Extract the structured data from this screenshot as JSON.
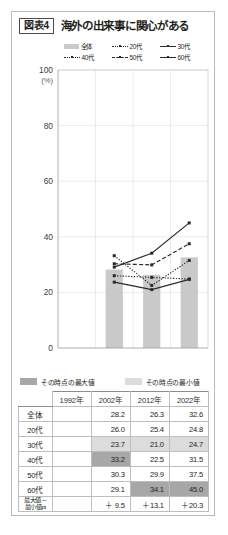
{
  "figure": {
    "badge": "図表4",
    "title": "海外の出来事に関心がある"
  },
  "legend": [
    {
      "label": "全体",
      "style": "bar"
    },
    {
      "label": "20代",
      "style": "dotted"
    },
    {
      "label": "30代",
      "style": "solid"
    },
    {
      "label": "40代",
      "style": "dotted"
    },
    {
      "label": "50代",
      "style": "dashed"
    },
    {
      "label": "60代",
      "style": "solid"
    }
  ],
  "minmax_legend": [
    {
      "label": "その時点の最大値",
      "color": "#a7a7a7"
    },
    {
      "label": "その時点の最小値",
      "color": "#dcdcdc"
    }
  ],
  "axis": {
    "y_unit": "(%)",
    "y_ticks": [
      "100",
      "80",
      "60",
      "40",
      "20",
      "0"
    ]
  },
  "chart_data": {
    "type": "line",
    "title": "海外の出来事に関心がある",
    "xlabel": "",
    "ylabel": "(%)",
    "ylim": [
      0,
      100
    ],
    "yticks": [
      0,
      20,
      40,
      60,
      80,
      100
    ],
    "grid": true,
    "legend_position": "top",
    "categories": [
      "1992年",
      "2002年",
      "2012年",
      "2022年"
    ],
    "bars": {
      "name": "全体",
      "color": "#c9c9c9",
      "values": [
        null,
        28.2,
        26.3,
        32.6
      ]
    },
    "series": [
      {
        "name": "20代",
        "style": "dotted",
        "values": [
          null,
          26.0,
          25.4,
          24.8
        ]
      },
      {
        "name": "30代",
        "style": "solid",
        "values": [
          null,
          23.7,
          21.0,
          24.7
        ]
      },
      {
        "name": "40代",
        "style": "dotted",
        "values": [
          null,
          33.2,
          22.5,
          31.5
        ]
      },
      {
        "name": "50代",
        "style": "dashed",
        "values": [
          null,
          30.3,
          29.9,
          37.5
        ]
      },
      {
        "name": "60代",
        "style": "solid",
        "values": [
          null,
          29.1,
          34.1,
          45.0
        ]
      }
    ]
  },
  "table": {
    "columns": [
      "",
      "1992年",
      "2002年",
      "2012年",
      "2022年"
    ],
    "rows": [
      {
        "label": "全体",
        "label_lines": [
          "全体"
        ],
        "values": [
          "",
          "28.2",
          "26.3",
          "32.6"
        ],
        "marks": [
          "",
          "",
          "",
          ""
        ]
      },
      {
        "label": "20代",
        "label_lines": [
          "20代"
        ],
        "values": [
          "",
          "26.0",
          "25.4",
          "24.8"
        ],
        "marks": [
          "",
          "",
          "",
          ""
        ]
      },
      {
        "label": "30代",
        "label_lines": [
          "30代"
        ],
        "values": [
          "",
          "23.7",
          "21.0",
          "24.7"
        ],
        "marks": [
          "",
          "min",
          "min",
          "min"
        ]
      },
      {
        "label": "40代",
        "label_lines": [
          "40代"
        ],
        "values": [
          "",
          "33.2",
          "22.5",
          "31.5"
        ],
        "marks": [
          "",
          "max",
          "",
          ""
        ]
      },
      {
        "label": "50代",
        "label_lines": [
          "50代"
        ],
        "values": [
          "",
          "30.3",
          "29.9",
          "37.5"
        ],
        "marks": [
          "",
          "",
          "",
          ""
        ]
      },
      {
        "label": "60代",
        "label_lines": [
          "60代"
        ],
        "values": [
          "",
          "29.1",
          "34.1",
          "45.0"
        ],
        "marks": [
          "",
          "",
          "max",
          "max"
        ]
      },
      {
        "label": "最大値－最小値pt",
        "label_lines": [
          "最大値－",
          "最小値pt"
        ],
        "values": [
          "",
          "＋ 9.5",
          "＋13.1",
          "＋20.3"
        ],
        "marks": [
          "",
          "",
          "",
          ""
        ],
        "last": true
      }
    ]
  }
}
